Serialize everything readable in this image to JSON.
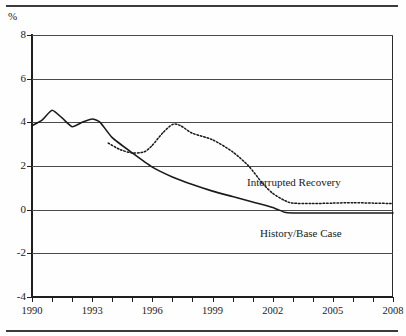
{
  "axis_unit_label": "%",
  "annotations": {
    "interrupted": "Interrupted Recovery",
    "history": "History/Base Case"
  },
  "chart_data": {
    "type": "line",
    "title": "",
    "subtitle": "",
    "xlabel": "",
    "ylabel": "%",
    "xlim": [
      1990,
      2008
    ],
    "ylim": [
      -4,
      8
    ],
    "yticks": [
      8,
      6,
      4,
      2,
      0,
      -2,
      -4
    ],
    "ytick_labels": [
      "8",
      "6",
      "4",
      "2",
      "0",
      "-2",
      "-4"
    ],
    "xticks": [
      1990,
      1991,
      1992,
      1993,
      1994,
      1995,
      1996,
      1997,
      1998,
      1999,
      2000,
      2001,
      2002,
      2003,
      2004,
      2005,
      2006,
      2007,
      2008
    ],
    "xtick_labels_shown": [
      "1990",
      "1993",
      "1996",
      "1999",
      "2002",
      "2005",
      "2008"
    ],
    "grid": true,
    "grid_axis": "y",
    "legend": "inline-annotations",
    "legend_position": "inline",
    "series": [
      {
        "name": "History/Base Case",
        "style": "solid",
        "color": "#1a1a1a",
        "x": [
          1990,
          1990.5,
          1991,
          1991.5,
          1992,
          1992.5,
          1993,
          1993.4,
          1994,
          1995,
          1996,
          1997,
          1998,
          1999,
          2000,
          2001,
          2002,
          2002.6,
          2003,
          2004,
          2005,
          2006,
          2007,
          2008
        ],
        "values": [
          3.85,
          4.1,
          4.55,
          4.2,
          3.8,
          4.0,
          4.15,
          4.0,
          3.3,
          2.6,
          1.95,
          1.5,
          1.15,
          0.85,
          0.6,
          0.35,
          0.1,
          -0.12,
          -0.15,
          -0.15,
          -0.15,
          -0.15,
          -0.15,
          -0.15
        ]
      },
      {
        "name": "Interrupted Recovery",
        "style": "dotted",
        "color": "#1a1a1a",
        "x": [
          1993.8,
          1994.4,
          1995,
          1995.6,
          1996,
          1996.5,
          1997,
          1997.4,
          1998,
          1999,
          2000,
          2000.8,
          2001.5,
          2002,
          2002.6,
          2003,
          2004,
          2005,
          2006,
          2007,
          2008
        ],
        "values": [
          3.05,
          2.75,
          2.6,
          2.65,
          2.95,
          3.5,
          3.9,
          3.85,
          3.5,
          3.2,
          2.65,
          2.0,
          1.2,
          0.75,
          0.42,
          0.3,
          0.28,
          0.3,
          0.32,
          0.3,
          0.28
        ]
      }
    ]
  }
}
